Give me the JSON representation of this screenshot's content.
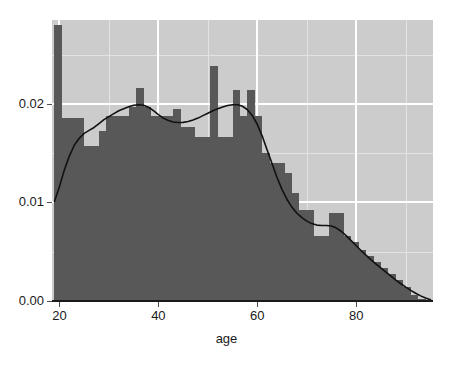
{
  "chart_data": {
    "type": "bar",
    "title": "",
    "subtitle": "",
    "xlabel": "age",
    "ylabel": "",
    "xlim": [
      18.5,
      95.5
    ],
    "ylim": [
      0.0,
      0.0285
    ],
    "grid": true,
    "legend": false,
    "legend_position": "none",
    "x_ticks": [
      20,
      40,
      60,
      80
    ],
    "x_tick_labels": [
      "20",
      "40",
      "60",
      "80"
    ],
    "x_minor_ticks": [
      30,
      50,
      70,
      90
    ],
    "y_ticks": [
      0.0,
      0.01,
      0.02
    ],
    "y_tick_labels": [
      "0.00",
      "0.01",
      "0.02"
    ],
    "y_minor_ticks": [
      0.005,
      0.015,
      0.025
    ],
    "bin_width": 1.5,
    "colors": {
      "bar_fill": "#585858",
      "panel_background": "#cccccc",
      "major_gridline": "#ffffff",
      "minor_gridline": "#e3e3e3",
      "density_line": "#111111",
      "axis_line": "#1a1a1a",
      "text": "#1a1a1a",
      "figure_background": "#ffffff"
    },
    "series": [
      {
        "name": "histogram (density)",
        "type": "bar",
        "bin_starts": [
          19.0,
          20.5,
          22.0,
          23.5,
          25.0,
          26.5,
          28.0,
          29.5,
          31.0,
          32.5,
          34.0,
          35.5,
          37.0,
          38.5,
          40.0,
          41.5,
          43.0,
          44.5,
          46.0,
          47.5,
          49.0,
          50.5,
          52.0,
          53.5,
          55.0,
          56.5,
          58.0,
          59.5,
          61.0,
          62.5,
          64.0,
          65.5,
          67.0,
          68.5,
          70.0,
          71.5,
          73.0,
          74.5,
          76.0,
          77.5,
          79.0,
          80.5,
          82.0,
          83.5,
          85.0,
          86.5,
          88.0,
          89.5,
          91.0,
          92.5
        ],
        "values": [
          0.028,
          0.0186,
          0.0186,
          0.0186,
          0.0157,
          0.0157,
          0.0172,
          0.0188,
          0.0188,
          0.0188,
          0.0197,
          0.0216,
          0.0197,
          0.0188,
          0.0188,
          0.0188,
          0.0195,
          0.0176,
          0.0176,
          0.0166,
          0.0166,
          0.0238,
          0.0166,
          0.0166,
          0.0214,
          0.0188,
          0.0214,
          0.0188,
          0.015,
          0.014,
          0.014,
          0.013,
          0.011,
          0.0092,
          0.0092,
          0.0066,
          0.0066,
          0.0089,
          0.0089,
          0.0066,
          0.006,
          0.0052,
          0.0046,
          0.004,
          0.0033,
          0.0027,
          0.0021,
          0.0014,
          0.0006,
          0.0002
        ]
      },
      {
        "name": "density estimate",
        "type": "line",
        "x": [
          19.0,
          20.0,
          21.0,
          22.0,
          23.0,
          24.0,
          25.0,
          26.0,
          27.0,
          28.0,
          29.0,
          30.0,
          31.0,
          32.0,
          33.0,
          34.0,
          35.0,
          36.0,
          37.0,
          38.0,
          39.0,
          40.0,
          41.0,
          42.0,
          43.0,
          44.0,
          45.0,
          46.0,
          47.0,
          48.0,
          49.0,
          50.0,
          51.0,
          52.0,
          53.0,
          54.0,
          55.0,
          56.0,
          57.0,
          58.0,
          59.0,
          60.0,
          61.0,
          62.0,
          63.0,
          64.0,
          65.0,
          66.0,
          67.0,
          68.0,
          69.0,
          70.0,
          71.0,
          72.0,
          73.0,
          74.0,
          75.0,
          76.0,
          77.0,
          78.0,
          79.0,
          80.0,
          81.0,
          82.0,
          83.0,
          84.0,
          85.0,
          86.0,
          87.0,
          88.0,
          89.0,
          90.0,
          91.0,
          92.0,
          93.0,
          94.0,
          95.0
        ],
        "y": [
          0.0101,
          0.0116,
          0.0133,
          0.0147,
          0.0158,
          0.0165,
          0.017,
          0.0173,
          0.0176,
          0.018,
          0.0184,
          0.0187,
          0.019,
          0.0193,
          0.0195,
          0.0197,
          0.01985,
          0.0199,
          0.01985,
          0.01965,
          0.0193,
          0.0189,
          0.01855,
          0.0183,
          0.01815,
          0.0181,
          0.01812,
          0.0182,
          0.01835,
          0.01855,
          0.0188,
          0.01905,
          0.0193,
          0.0195,
          0.01968,
          0.01982,
          0.0199,
          0.0199,
          0.01975,
          0.0194,
          0.0188,
          0.0179,
          0.0167,
          0.0153,
          0.0139,
          0.0125,
          0.0113,
          0.0103,
          0.0095,
          0.0089,
          0.00845,
          0.0081,
          0.00785,
          0.0077,
          0.00765,
          0.00765,
          0.0076,
          0.0074,
          0.00705,
          0.0066,
          0.0061,
          0.0056,
          0.0051,
          0.00462,
          0.00418,
          0.00375,
          0.00333,
          0.00292,
          0.00252,
          0.00212,
          0.00175,
          0.0014,
          0.00108,
          0.00078,
          0.00052,
          0.0003,
          0.00012
        ]
      }
    ]
  }
}
